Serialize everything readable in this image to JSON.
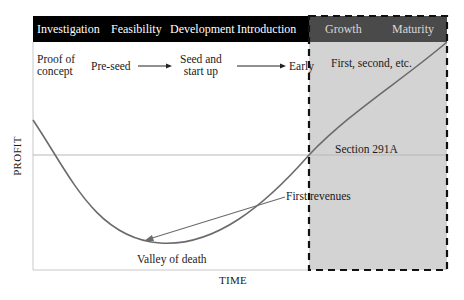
{
  "header": {
    "stages": [
      {
        "label": "Investigation"
      },
      {
        "label": "Feasibility"
      },
      {
        "label": "Development"
      },
      {
        "label": "Introduction"
      },
      {
        "label": "Growth"
      },
      {
        "label": "Maturity"
      }
    ],
    "colors": {
      "left_bar": "#000000",
      "right_bar": "#4a4a4a",
      "right_region": "#d3d3d3"
    }
  },
  "funding_stages": [
    {
      "label": "Proof of concept",
      "line1": "Proof of",
      "line2": "concept"
    },
    {
      "label": "Pre-seed"
    },
    {
      "label": "Seed and start up",
      "line1": "Seed and",
      "line2": "start up"
    },
    {
      "label": "Early"
    },
    {
      "label": "First, second, etc."
    }
  ],
  "annotations": {
    "section": "Section 291A",
    "first_revenues": "First revenues",
    "valley": "Valley of death"
  },
  "axes": {
    "x_label": "TIME",
    "y_label": "PROFIT"
  },
  "colors": {
    "curve": "#6b6b6b",
    "zero_line": "#b8b8b8",
    "dashed_border": "#111111"
  }
}
